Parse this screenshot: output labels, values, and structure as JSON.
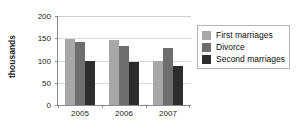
{
  "chart_data": {
    "type": "bar",
    "title": "",
    "subtitle": "",
    "xlabel": "",
    "ylabel": "thousands",
    "categories": [
      "2005",
      "2006",
      "2007"
    ],
    "series": [
      {
        "name": "First marriages",
        "values": [
          149,
          146,
          99
        ],
        "color": "#a8a8a8"
      },
      {
        "name": "Divorce",
        "values": [
          142,
          133,
          128
        ],
        "color": "#6e6e6e"
      },
      {
        "name": "Second marriages",
        "values": [
          98,
          96,
          88
        ],
        "color": "#2d2d2d"
      }
    ],
    "ylim": [
      0,
      200
    ],
    "yticks": [
      0,
      50,
      100,
      150,
      200
    ],
    "ytick_labels": [
      "0",
      "50",
      "100",
      "150",
      "200"
    ],
    "grid": true,
    "grid_axis": "y",
    "legend_position": "right",
    "legend_border": true,
    "axis_color": "#8a8a8a",
    "grid_color": "#d9d9d9"
  },
  "legend": {
    "entries": [
      {
        "label": "First marriages",
        "swatch": "legend-swatch-first-marriages"
      },
      {
        "label": "Divorce",
        "swatch": "legend-swatch-divorce"
      },
      {
        "label": "Second marriages",
        "swatch": "legend-swatch-second-marriages"
      }
    ]
  },
  "axes": {
    "y_title": "thousands",
    "y_tick_0": "0",
    "y_tick_1": "50",
    "y_tick_2": "100",
    "y_tick_3": "150",
    "y_tick_4": "200",
    "x_tick_0": "2005",
    "x_tick_1": "2006",
    "x_tick_2": "2007"
  }
}
